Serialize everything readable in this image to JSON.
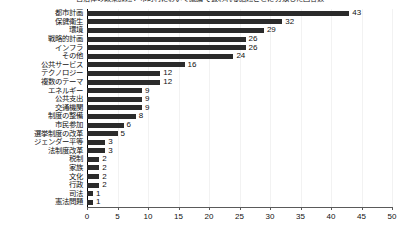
{
  "chart_data": {
    "type": "bar",
    "orientation": "horizontal",
    "title": "自治体の政策課題：市町村において議論で扱われる話題ごとに分類した回答数",
    "xlabel": "",
    "ylabel": "",
    "xlim": [
      0,
      50
    ],
    "xticks": [
      0,
      5,
      10,
      15,
      20,
      25,
      30,
      35,
      40,
      45,
      50
    ],
    "grid": false,
    "legend": null,
    "bar_color": "#2b2b2b",
    "show_value_labels": true,
    "categories": [
      "都市計画",
      "保健衛生",
      "環境",
      "戦略的計画",
      "インフラ",
      "その他",
      "公共サービス",
      "テクノロジー",
      "複数のテーマ",
      "エネルギー",
      "公共支出",
      "交通機関",
      "制度の整備",
      "市民参加",
      "選挙制度の改革",
      "ジェンダー平等",
      "法制度改革",
      "税制",
      "家族",
      "文化",
      "行政",
      "司法",
      "憲法問題"
    ],
    "values": [
      43,
      32,
      29,
      26,
      26,
      24,
      16,
      12,
      12,
      9,
      9,
      9,
      8,
      6,
      5,
      3,
      3,
      2,
      2,
      2,
      2,
      1,
      1
    ]
  }
}
